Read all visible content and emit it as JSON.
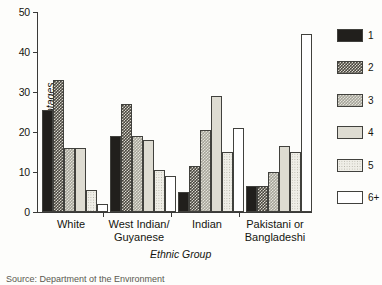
{
  "chart_data": {
    "type": "bar",
    "title": "",
    "xlabel": "Ethnic Group",
    "ylabel": "Percentages",
    "ylim": [
      0,
      50
    ],
    "yticks": [
      0,
      10,
      20,
      30,
      40,
      50
    ],
    "ytick_labels": [
      "0",
      "10",
      "20",
      "30",
      "40",
      "50"
    ],
    "grid": false,
    "legend_position": "right",
    "legend_title": "",
    "categories": [
      "White",
      "West Indian/Guyanese",
      "Indian",
      "Pakistani or Bangladeshi"
    ],
    "series": [
      {
        "name": "1",
        "values": [
          25.5,
          19.0,
          5.0,
          6.5
        ]
      },
      {
        "name": "2",
        "values": [
          33.0,
          27.0,
          11.5,
          6.5
        ]
      },
      {
        "name": "3",
        "values": [
          16.0,
          19.0,
          20.5,
          10.0
        ]
      },
      {
        "name": "4",
        "values": [
          16.0,
          18.0,
          29.0,
          16.5
        ]
      },
      {
        "name": "5",
        "values": [
          5.5,
          10.5,
          15.0,
          15.0
        ]
      },
      {
        "name": "6+",
        "values": [
          2.0,
          9.0,
          21.0,
          44.5
        ]
      }
    ]
  },
  "axes": {
    "ylabel": "Percentages",
    "xlabel": "Ethnic Group",
    "ticks": [
      {
        "value": 50,
        "label": "50"
      },
      {
        "value": 40,
        "label": "40"
      },
      {
        "value": 30,
        "label": "30"
      },
      {
        "value": 20,
        "label": "20"
      },
      {
        "value": 10,
        "label": "10"
      },
      {
        "value": 0,
        "label": "0"
      }
    ]
  },
  "groups": [
    {
      "label_line1": "White",
      "label_line2": ""
    },
    {
      "label_line1": "West Indian/",
      "label_line2": "Guyanese"
    },
    {
      "label_line1": "Indian",
      "label_line2": ""
    },
    {
      "label_line1": "Pakistani or",
      "label_line2": "Bangladeshi"
    }
  ],
  "legend": {
    "items": [
      {
        "label": "1",
        "pattern": "solid-black",
        "color": "#211f1c"
      },
      {
        "label": "2",
        "pattern": "dark-checker",
        "color": "#4a473f"
      },
      {
        "label": "3",
        "pattern": "mid-checker",
        "color": "#a5a49a"
      },
      {
        "label": "4",
        "pattern": "light-solid",
        "color": "#dedcd2"
      },
      {
        "label": "5",
        "pattern": "light-dotted",
        "color": "#efeee7"
      },
      {
        "label": "6+",
        "pattern": "white-outline",
        "color": "#ffffff"
      }
    ]
  },
  "footer": {
    "clipped_caption": "Source: Department of the Environment"
  }
}
